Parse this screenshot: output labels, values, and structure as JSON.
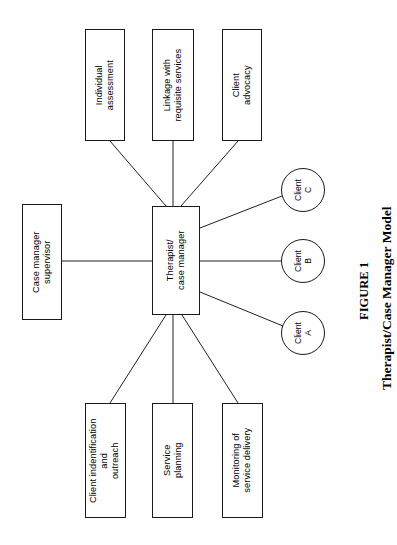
{
  "figure": {
    "caption_label": "FIGURE 1",
    "caption_title": "Therapist/Case Manager Model",
    "orientation": "rotated-90-ccw",
    "background_color": "#fefefe",
    "stroke_color": "#222222"
  },
  "diagram": {
    "type": "node-link-diagram",
    "center": {
      "id": "therapist-case-manager",
      "label": "Therapist/\ncase manager",
      "shape": "rectangle"
    },
    "boxes": [
      {
        "id": "individual-assessment",
        "label": "Individual\nassessment",
        "shape": "rectangle"
      },
      {
        "id": "linkage-with-requisite-services",
        "label": "Linkage with\nrequisite services",
        "shape": "rectangle"
      },
      {
        "id": "client-advocacy",
        "label": "Client\nadvocacy",
        "shape": "rectangle"
      },
      {
        "id": "case-manager-supervisor",
        "label": "Case manager\nsupervisor",
        "shape": "rectangle"
      },
      {
        "id": "client-identification-outreach",
        "label": "Client indentification\nand\noutreach",
        "shape": "rectangle"
      },
      {
        "id": "service-planning",
        "label": "Service\nplanning",
        "shape": "rectangle"
      },
      {
        "id": "monitoring-of-service-delivery",
        "label": "Monitoring of\nservice delivery",
        "shape": "rectangle"
      }
    ],
    "circles": [
      {
        "id": "client-c",
        "label": "Client\nC",
        "shape": "circle"
      },
      {
        "id": "client-b",
        "label": "Client\nB",
        "shape": "circle"
      },
      {
        "id": "client-a",
        "label": "Client\nA",
        "shape": "circle"
      }
    ],
    "edges": [
      {
        "from": "therapist-case-manager",
        "to": "individual-assessment"
      },
      {
        "from": "therapist-case-manager",
        "to": "linkage-with-requisite-services"
      },
      {
        "from": "therapist-case-manager",
        "to": "client-advocacy"
      },
      {
        "from": "therapist-case-manager",
        "to": "case-manager-supervisor"
      },
      {
        "from": "therapist-case-manager",
        "to": "client-identification-outreach"
      },
      {
        "from": "therapist-case-manager",
        "to": "service-planning"
      },
      {
        "from": "therapist-case-manager",
        "to": "monitoring-of-service-delivery"
      },
      {
        "from": "therapist-case-manager",
        "to": "client-c"
      },
      {
        "from": "therapist-case-manager",
        "to": "client-b"
      },
      {
        "from": "therapist-case-manager",
        "to": "client-a"
      }
    ]
  }
}
